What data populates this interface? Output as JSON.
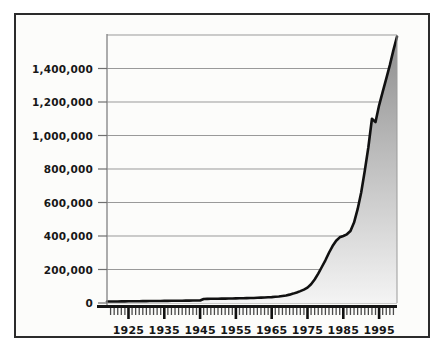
{
  "figure": {
    "name": "growth-line-area-chart",
    "background_color": "#fdfdfb",
    "frame_color": "#2b2b2b"
  },
  "chart_data": {
    "type": "area",
    "title": "",
    "subtitle": "",
    "xlabel": "",
    "ylabel": "",
    "xlim": [
      1919,
      2000
    ],
    "ylim": [
      0,
      1600000
    ],
    "grid": true,
    "grid_axis": "y",
    "legend": false,
    "legend_position": "none",
    "line_color": "#111111",
    "fill_gradient_top": "#8e8e8e",
    "fill_gradient_bottom": "#f2f2f2",
    "y_ticks": [
      0,
      200000,
      400000,
      600000,
      800000,
      1000000,
      1200000,
      1400000
    ],
    "y_tick_labels": [
      "0",
      "200,000",
      "400,000",
      "600,000",
      "800,000",
      "1,000,000",
      "1,200,000",
      "1,400,000"
    ],
    "x_tick_labels": [
      "1925",
      "1935",
      "1945",
      "1955",
      "1965",
      "1975",
      "1985",
      "1995"
    ],
    "x_major_ticks": [
      1925,
      1935,
      1945,
      1955,
      1965,
      1975,
      1985,
      1995
    ],
    "x_minor_tick_interval": 1,
    "x": [
      1919,
      1920,
      1921,
      1922,
      1923,
      1924,
      1925,
      1926,
      1927,
      1928,
      1929,
      1930,
      1931,
      1932,
      1933,
      1934,
      1935,
      1936,
      1937,
      1938,
      1939,
      1940,
      1941,
      1942,
      1943,
      1944,
      1945,
      1946,
      1947,
      1948,
      1949,
      1950,
      1951,
      1952,
      1953,
      1954,
      1955,
      1956,
      1957,
      1958,
      1959,
      1960,
      1961,
      1962,
      1963,
      1964,
      1965,
      1966,
      1967,
      1968,
      1969,
      1970,
      1971,
      1972,
      1973,
      1974,
      1975,
      1976,
      1977,
      1978,
      1979,
      1980,
      1981,
      1982,
      1983,
      1984,
      1985,
      1986,
      1987,
      1988,
      1989,
      1990,
      1991,
      1992,
      1993,
      1994,
      1995,
      1996,
      1997,
      1998,
      1999,
      2000
    ],
    "values": [
      9000,
      9000,
      9000,
      9000,
      9500,
      9500,
      10000,
      10000,
      10500,
      10500,
      11000,
      11000,
      11500,
      11500,
      12000,
      12000,
      12500,
      12500,
      13000,
      13000,
      13500,
      13500,
      14000,
      14000,
      14500,
      14500,
      15000,
      24000,
      24500,
      25000,
      25000,
      25500,
      26000,
      26000,
      26500,
      27000,
      27500,
      28000,
      28500,
      29000,
      29500,
      30000,
      31000,
      32000,
      33000,
      34000,
      35000,
      37000,
      39000,
      42000,
      45000,
      50000,
      56000,
      63000,
      71000,
      80000,
      92000,
      112000,
      140000,
      175000,
      215000,
      255000,
      300000,
      340000,
      372000,
      392000,
      400000,
      410000,
      430000,
      480000,
      560000,
      660000,
      790000,
      930000,
      1100000,
      1080000,
      1180000,
      1260000,
      1340000,
      1420000,
      1510000,
      1590000
    ],
    "series_name": "cumulative-total",
    "annotations": [
      {
        "label": "step-increase",
        "x": 1946,
        "note": "small upward step"
      },
      {
        "label": "plateau",
        "x": 1985,
        "note": "brief flattening near 400,000"
      },
      {
        "label": "notch",
        "x": 1994,
        "note": "small dip near 1,100,000"
      }
    ]
  }
}
